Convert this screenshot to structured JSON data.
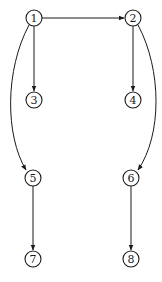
{
  "diagram": {
    "type": "directed-graph",
    "colors": {
      "stroke": "#1a1a1a",
      "background": "#ffffff"
    },
    "nodes": [
      {
        "id": "1",
        "label": "1",
        "x": 34,
        "y": 18
      },
      {
        "id": "2",
        "label": "2",
        "x": 133,
        "y": 18
      },
      {
        "id": "3",
        "label": "3",
        "x": 34,
        "y": 100
      },
      {
        "id": "4",
        "label": "4",
        "x": 133,
        "y": 100
      },
      {
        "id": "5",
        "label": "5",
        "x": 33,
        "y": 178
      },
      {
        "id": "6",
        "label": "6",
        "x": 131,
        "y": 178
      },
      {
        "id": "7",
        "label": "7",
        "x": 33,
        "y": 259
      },
      {
        "id": "8",
        "label": "8",
        "x": 131,
        "y": 259
      }
    ],
    "edges": [
      {
        "from": "1",
        "to": "2",
        "shape": "straight"
      },
      {
        "from": "1",
        "to": "3",
        "shape": "straight"
      },
      {
        "from": "2",
        "to": "4",
        "shape": "straight"
      },
      {
        "from": "1",
        "to": "5",
        "shape": "curved"
      },
      {
        "from": "2",
        "to": "6",
        "shape": "curved"
      },
      {
        "from": "5",
        "to": "7",
        "shape": "straight"
      },
      {
        "from": "6",
        "to": "8",
        "shape": "straight"
      }
    ]
  }
}
